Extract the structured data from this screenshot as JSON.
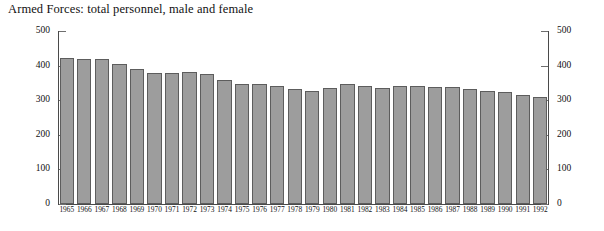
{
  "chart_data": {
    "type": "bar",
    "title": "Armed Forces: total personnel, male and female",
    "xlabel": "",
    "ylabel": "",
    "ylim": [
      0,
      500
    ],
    "grid": false,
    "legend": null,
    "dual_axis": true,
    "yticks": [
      0,
      100,
      200,
      300,
      400,
      500
    ],
    "y_tick_labels_left": [
      "0",
      "100",
      "200",
      "300",
      "400",
      "500"
    ],
    "y_tick_labels_right": [
      "0",
      "100",
      "200",
      "300",
      "400",
      "500"
    ],
    "bar_color": "#9d9d9d",
    "bar_edge_color": "#5d5d5d",
    "axis_color": "#4a4a4a",
    "categories": [
      "1965",
      "1966",
      "1967",
      "1968",
      "1969",
      "1970",
      "1971",
      "1972",
      "1973",
      "1974",
      "1975",
      "1976",
      "1977",
      "1978",
      "1979",
      "1980",
      "1981",
      "1982",
      "1983",
      "1984",
      "1985",
      "1986",
      "1987",
      "1988",
      "1989",
      "1990",
      "1991",
      "1992"
    ],
    "values": [
      423,
      420,
      420,
      405,
      390,
      378,
      378,
      381,
      376,
      359,
      348,
      348,
      341,
      332,
      327,
      334,
      348,
      342,
      336,
      340,
      341,
      338,
      337,
      333,
      328,
      323,
      315,
      309
    ]
  }
}
